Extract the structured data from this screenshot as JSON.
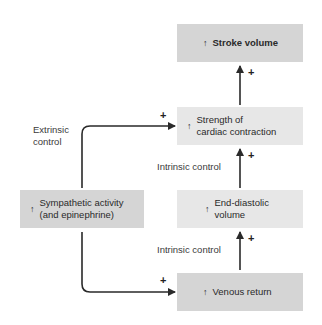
{
  "diagram": {
    "boxes": {
      "stroke_volume": {
        "arrow": "↑",
        "text": "Stroke volume"
      },
      "strength": {
        "arrow": "↑",
        "text": "Strength of\ncardiac contraction"
      },
      "sympathetic": {
        "arrow": "↑",
        "text": "Sympathetic activity\n(and epinephrine)"
      },
      "edv": {
        "arrow": "↑",
        "text": "End-diastolic\nvolume"
      },
      "venous": {
        "arrow": "↑",
        "text": "Venous return"
      }
    },
    "labels": {
      "extrinsic": "Extrinsic\ncontrol",
      "intrinsic_upper": "Intrinsic control",
      "intrinsic_lower": "Intrinsic control"
    },
    "signs": {
      "strength_to_sv": "+",
      "edv_to_strength": "+",
      "venous_to_edv": "+",
      "symp_to_strength": "+",
      "symp_to_venous": "+"
    },
    "colors": {
      "dark_box": "#d5d5d5",
      "light_box": "#e7e7e7",
      "arrow": "#2a2a2a"
    }
  }
}
